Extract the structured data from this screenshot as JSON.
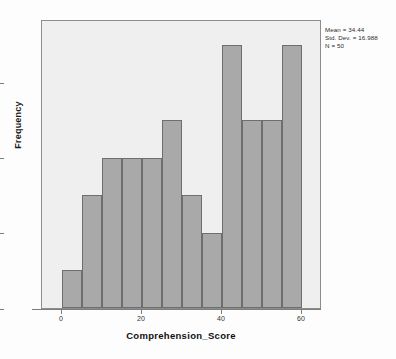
{
  "chart_data": {
    "type": "bar",
    "title": "",
    "xlabel": "Comprehension_Score",
    "ylabel": "Frequency",
    "categories": [
      "0-5",
      "5-10",
      "10-15",
      "15-20",
      "20-25",
      "25-30",
      "30-35",
      "35-40",
      "40-45",
      "45-50",
      "50-55",
      "55-60"
    ],
    "bin_starts": [
      0,
      5,
      10,
      15,
      20,
      25,
      30,
      35,
      40,
      45,
      50,
      55
    ],
    "bin_width": 5,
    "values": [
      1,
      3,
      4,
      4,
      4,
      5,
      3,
      2,
      7,
      5,
      5,
      7
    ],
    "xlim": [
      -5,
      65
    ],
    "ylim": [
      0,
      7.7
    ],
    "x_ticks": [
      0,
      20,
      40,
      60
    ],
    "x_tick_labels": [
      "0",
      "20",
      "40",
      "60"
    ],
    "y_ticks": [
      0,
      2,
      4,
      6
    ],
    "y_tick_labels": [
      "0",
      "2",
      "4",
      "6"
    ],
    "grid": false,
    "legend": "none",
    "bar_color": "#a9a9a9",
    "bar_border_color": "#6e6e6e",
    "plot_background": "#efefef"
  },
  "annotation": {
    "mean_line": "Mean = 34.44",
    "stddev_line": "Std. Dev. = 16.988",
    "n_line": "N = 50"
  }
}
